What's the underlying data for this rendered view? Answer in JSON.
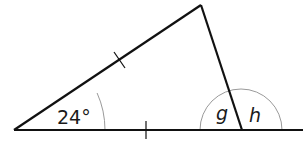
{
  "diagram": {
    "type": "geometry-triangle",
    "colors": {
      "line": "#111111",
      "arc": "#9a9a9a",
      "text": "#1a1a1a",
      "background": "#ffffff"
    },
    "points": {
      "left_vertex": [
        14,
        130
      ],
      "apex": [
        201,
        5
      ],
      "right_vertex": [
        242,
        130
      ],
      "baseline_end": [
        303,
        130
      ]
    },
    "labels": {
      "angle_left": "24°",
      "angle_g": "g",
      "angle_h": "h"
    },
    "tick_marks": [
      "left-side-equal-mark",
      "base-equal-mark"
    ]
  }
}
